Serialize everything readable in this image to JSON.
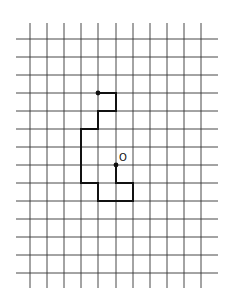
{
  "diagram": {
    "type": "grid-path",
    "grid": {
      "columns_x": [
        30,
        47,
        64,
        81,
        98,
        116,
        133,
        150,
        167,
        184,
        201
      ],
      "rows_y": [
        39,
        57,
        75,
        93,
        111,
        129,
        147,
        165,
        183,
        201,
        219,
        237,
        255,
        273
      ],
      "vertical_extent": [
        23,
        288
      ],
      "horizontal_extent": [
        16,
        218
      ],
      "line_color": "#333333"
    },
    "path": {
      "vertices_grid": [
        [
          4,
          3
        ],
        [
          5,
          3
        ],
        [
          5,
          4
        ],
        [
          4,
          4
        ],
        [
          4,
          5
        ],
        [
          3,
          5
        ],
        [
          3,
          8
        ],
        [
          4,
          8
        ],
        [
          4,
          9
        ],
        [
          6,
          9
        ],
        [
          6,
          8
        ],
        [
          5,
          8
        ],
        [
          5,
          7
        ]
      ],
      "stroke_color": "#111111",
      "start_dot": [
        4,
        3
      ],
      "end_dot": [
        5,
        7
      ]
    },
    "origin_label": "O",
    "origin_label_pos": {
      "x": 119,
      "y": 152
    }
  }
}
